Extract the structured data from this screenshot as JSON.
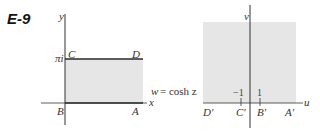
{
  "figure": {
    "label": "E-9",
    "mapping": "w = cosh z",
    "mapping_w": "w",
    "mapping_rest": "= cosh z"
  },
  "left_plane": {
    "x_axis_label": "x",
    "y_axis_label": "y",
    "y_tick": "πi",
    "region": "semi-infinite strip 0 ≤ y ≤ π, x ≥ 0",
    "points": {
      "A": "A",
      "B": "B",
      "C": "C",
      "D": "D"
    },
    "fill_color": "#e6e6e6",
    "boundary_color": "#2a2a2a"
  },
  "right_plane": {
    "u_axis_label": "u",
    "v_axis_label": "v",
    "ticks": [
      "−1",
      "1"
    ],
    "region": "upper half-plane",
    "points": {
      "A": "A′",
      "B": "B′",
      "C": "C′",
      "D": "D′"
    },
    "fill_color": "#e6e6e6"
  }
}
